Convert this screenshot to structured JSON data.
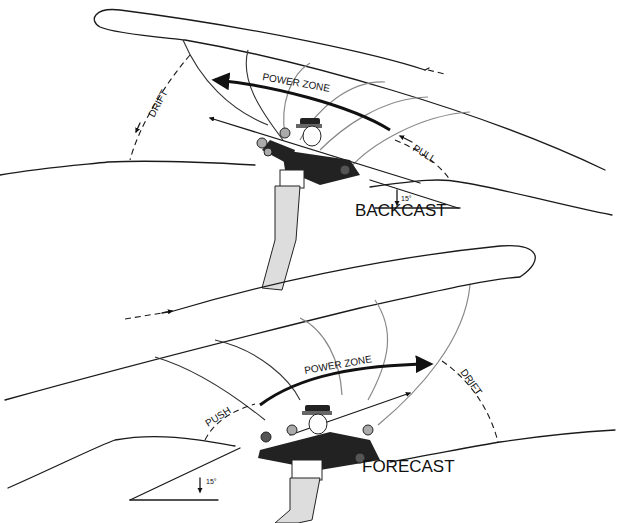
{
  "diagram": {
    "backcast": {
      "title": "BACKCAST",
      "labels": {
        "power_zone": "POWER ZONE",
        "drift": "DRIFT",
        "pull": "PULL",
        "angle": "15°"
      }
    },
    "forecast": {
      "title": "FORECAST",
      "labels": {
        "power_zone": "POWER ZONE",
        "drift": "DRIFT",
        "push": "PUSH",
        "angle": "15°"
      }
    }
  }
}
